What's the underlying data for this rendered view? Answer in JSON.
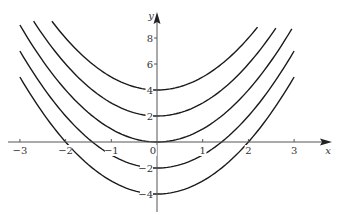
{
  "chart_data": {
    "type": "line",
    "title": "",
    "xlabel": "x",
    "ylabel": "y",
    "xlim": [
      -3.3,
      3.5
    ],
    "ylim": [
      -4.8,
      9.9
    ],
    "grid": false,
    "legend": null,
    "x_ticks": [
      -3,
      -2,
      -1,
      0,
      1,
      2,
      3
    ],
    "x_tick_labels": [
      "−3",
      "−2",
      "−1",
      "0",
      "1",
      "2",
      "3"
    ],
    "y_ticks": [
      -4,
      -2,
      2,
      4,
      6,
      8
    ],
    "y_tick_labels": [
      "−4",
      "−2",
      "2",
      "4",
      "6",
      "8"
    ],
    "series": [
      {
        "name": "C = 4",
        "C": 4,
        "x_range": [
          -2.3,
          2.2
        ]
      },
      {
        "name": "C = 2",
        "C": 2,
        "x_range": [
          -2.7,
          2.6
        ]
      },
      {
        "name": "C = 0",
        "C": 0,
        "x_range": [
          -3.0,
          2.95
        ]
      },
      {
        "name": "C = -2",
        "C": -2,
        "x_range": [
          -3.0,
          3.0
        ]
      },
      {
        "name": "C = -4",
        "C": -4,
        "x_range": [
          -3.0,
          3.0
        ]
      }
    ],
    "colors": {
      "curve": "#1a1a1a",
      "axis": "#555555",
      "text": "#333333"
    }
  }
}
